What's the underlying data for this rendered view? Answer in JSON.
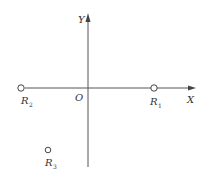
{
  "diagram": {
    "type": "coordinate-plane",
    "axes": {
      "x_label": "X",
      "y_label": "Y",
      "origin_label": "O",
      "color": "#555555"
    },
    "points": [
      {
        "id": "R1",
        "base": "R",
        "sub": "1",
        "x": 154,
        "y": 88
      },
      {
        "id": "R2",
        "base": "R",
        "sub": "2",
        "x": 21,
        "y": 88
      },
      {
        "id": "R3",
        "base": "R",
        "sub": "3",
        "x": 48,
        "y": 150
      }
    ]
  }
}
